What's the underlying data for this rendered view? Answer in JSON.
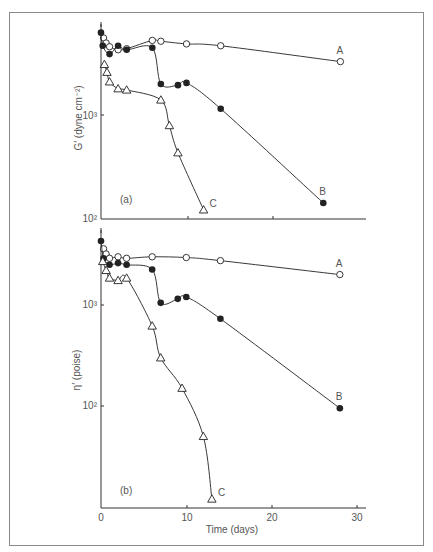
{
  "chart_data": [
    {
      "panel": "(a)",
      "type": "line",
      "scale_y": "log",
      "xlabel": "",
      "ylabel": "G′ (dyne cm⁻²)",
      "ylim": [
        100,
        6500
      ],
      "xlim": [
        0,
        30
      ],
      "yticks": [
        {
          "value": 100,
          "label": "10²"
        },
        {
          "value": 1000,
          "label": "10³"
        }
      ],
      "xticks": [
        0,
        10,
        20,
        30
      ],
      "series": [
        {
          "name": "A",
          "marker": "open-circle",
          "x": [
            0.3,
            0.6,
            1,
            2,
            3,
            6,
            7,
            10,
            14,
            28
          ],
          "y": [
            5600,
            5000,
            4600,
            4300,
            4400,
            5300,
            5200,
            4900,
            4700,
            3300
          ]
        },
        {
          "name": "B",
          "marker": "filled-circle",
          "x": [
            0,
            0.2,
            1,
            2,
            3,
            6,
            7,
            9,
            10,
            14,
            26
          ],
          "y": [
            6300,
            4700,
            3900,
            4700,
            4300,
            4500,
            2000,
            1950,
            2050,
            1150,
            140
          ]
        },
        {
          "name": "C",
          "marker": "open-triangle",
          "x": [
            0.4,
            0.7,
            1,
            2,
            3,
            7,
            8,
            9,
            12
          ],
          "y": [
            3100,
            2600,
            2100,
            1800,
            1750,
            1400,
            790,
            430,
            120
          ]
        }
      ],
      "annotations": [
        "A",
        "B",
        "C",
        "(a)"
      ]
    },
    {
      "panel": "(b)",
      "type": "line",
      "scale_y": "log",
      "xlabel": "Time (days)",
      "ylabel": "η′ (poise)",
      "ylim": [
        12,
        4500
      ],
      "xlim": [
        0,
        30
      ],
      "yticks": [
        {
          "value": 100,
          "label": "10²"
        },
        {
          "value": 1000,
          "label": "10³"
        }
      ],
      "xticks": [
        0,
        10,
        20,
        30
      ],
      "series": [
        {
          "name": "A",
          "marker": "open-circle",
          "x": [
            0.3,
            0.6,
            1,
            2,
            3,
            6,
            10,
            14,
            28
          ],
          "y": [
            3600,
            3200,
            2900,
            3000,
            2900,
            3000,
            2950,
            2750,
            2000
          ]
        },
        {
          "name": "B",
          "marker": "filled-circle",
          "x": [
            0,
            0.3,
            1,
            2,
            3,
            6,
            7,
            9,
            10,
            14,
            28
          ],
          "y": [
            4300,
            2900,
            2500,
            2600,
            2500,
            2250,
            1050,
            1150,
            1200,
            730,
            95
          ]
        },
        {
          "name": "C",
          "marker": "open-triangle",
          "x": [
            0.2,
            0.6,
            1,
            2,
            3,
            6,
            7,
            9.5,
            12,
            13
          ],
          "y": [
            2700,
            2200,
            1850,
            1750,
            1850,
            620,
            300,
            150,
            50,
            12
          ]
        }
      ],
      "annotations": [
        "A",
        "B",
        "C",
        "(b)"
      ]
    }
  ],
  "labels": {
    "panel_a": "(a)",
    "panel_b": "(b)",
    "ylabel_a": "G′ (dyne cm⁻²)",
    "ylabel_b": "η′ (poise)",
    "xlabel": "Time (days)",
    "tick_1e3": "10³",
    "tick_1e2": "10²",
    "x0": "0",
    "x10": "10",
    "x20": "20",
    "x30": "30",
    "A": "A",
    "B": "B",
    "C": "C"
  },
  "colors": {
    "ink": "#222222",
    "frame": "#777777",
    "text": "#555555"
  }
}
